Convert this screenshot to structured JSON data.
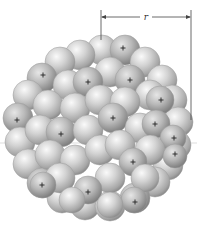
{
  "diagram": {
    "radius_label": "r",
    "proton_symbol": "+",
    "colors": {
      "sphere_light": "#f2f2f2",
      "sphere_mid": "#c4c4c4",
      "sphere_dark": "#8a8a8a",
      "line": "#555555",
      "background": "#ffffff"
    },
    "protons": [
      {
        "x": 123,
        "y": 48
      },
      {
        "x": 43,
        "y": 75
      },
      {
        "x": 88,
        "y": 82
      },
      {
        "x": 130,
        "y": 80
      },
      {
        "x": 161,
        "y": 100
      },
      {
        "x": 17,
        "y": 120
      },
      {
        "x": 113,
        "y": 118
      },
      {
        "x": 61,
        "y": 134
      },
      {
        "x": 155,
        "y": 124
      },
      {
        "x": 174,
        "y": 138
      },
      {
        "x": 133,
        "y": 162
      },
      {
        "x": 175,
        "y": 154
      },
      {
        "x": 42,
        "y": 185
      },
      {
        "x": 88,
        "y": 192
      },
      {
        "x": 135,
        "y": 202
      }
    ]
  }
}
